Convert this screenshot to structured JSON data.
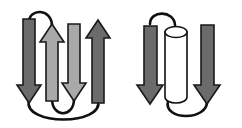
{
  "figure": {
    "name": "protein-secondary-structure-topology",
    "background_color": "#ffffff",
    "width": 242,
    "height": 128,
    "panel_count": 2
  },
  "palette": {
    "dark_strand": "#6b6b6b",
    "light_strand": "#a9a9a9",
    "helix_fill": "#ffffff",
    "outline": "#101010",
    "background": "#ffffff"
  },
  "panels": [
    {
      "id": "left-panel",
      "label": "beta-meander-four-strand-sheet",
      "element_count": 4,
      "elements": [
        {
          "id": "strand-1",
          "type": "beta-strand",
          "direction": "down",
          "color": "#6b6b6b",
          "shade": "dark",
          "shaft_x": 23,
          "shaft_width": 12,
          "top_y": 19,
          "bottom_y": 103,
          "head_width": 24,
          "head_height": 18
        },
        {
          "id": "strand-2",
          "type": "beta-strand",
          "direction": "up",
          "color": "#a9a9a9",
          "shade": "light",
          "shaft_x": 46,
          "shaft_width": 12,
          "top_y": 24,
          "bottom_y": 101,
          "head_width": 24,
          "head_height": 18
        },
        {
          "id": "strand-3",
          "type": "beta-strand",
          "direction": "down",
          "color": "#a9a9a9",
          "shade": "light",
          "shaft_x": 68,
          "shaft_width": 12,
          "top_y": 24,
          "bottom_y": 101,
          "head_width": 24,
          "head_height": 18
        },
        {
          "id": "strand-4",
          "type": "beta-strand",
          "direction": "up",
          "color": "#6b6b6b",
          "shade": "dark",
          "shaft_x": 92,
          "shaft_width": 12,
          "top_y": 20,
          "bottom_y": 103,
          "head_width": 24,
          "head_height": 18
        }
      ],
      "loops": [
        {
          "id": "loop-top-1-2",
          "connects": "strand-1-top to strand-2-top",
          "position": "top",
          "size": "small",
          "path": "M 29 22 C 29 8, 52 8, 52 26"
        },
        {
          "id": "loop-bottom-2-3",
          "connects": "strand-2-bottom to strand-3-bottom",
          "position": "bottom",
          "size": "small",
          "path": "M 52 99 C 52 118, 74 118, 74 99"
        },
        {
          "id": "loop-bottom-1-4",
          "connects": "strand-1-bottom to strand-4-bottom",
          "position": "bottom",
          "size": "large",
          "path": "M 29 100 C 22 126, 105 126, 98 100"
        }
      ]
    },
    {
      "id": "right-panel",
      "label": "beta-alpha-beta-motif",
      "element_count": 3,
      "elements": [
        {
          "id": "strand-5",
          "type": "beta-strand",
          "direction": "down",
          "color": "#6b6b6b",
          "shade": "dark",
          "shaft_x": 144,
          "shaft_width": 13,
          "top_y": 26,
          "bottom_y": 104,
          "head_width": 25,
          "head_height": 19
        },
        {
          "id": "helix-1",
          "type": "alpha-helix-cylinder",
          "color": "#ffffff",
          "shade": "white",
          "center_x": 176,
          "width": 22,
          "top_y": 27,
          "bottom_y": 102,
          "cap_ellipse_ry": 5
        },
        {
          "id": "strand-6",
          "type": "beta-strand",
          "direction": "down",
          "color": "#6b6b6b",
          "shade": "dark",
          "shaft_x": 201,
          "shaft_width": 13,
          "top_y": 25,
          "bottom_y": 104,
          "head_width": 25,
          "head_height": 19
        }
      ],
      "loops": [
        {
          "id": "loop-top-strand5-helix",
          "connects": "strand-5-top to helix-top",
          "position": "top",
          "size": "small",
          "path": "M 150 24 C 150 10, 174 10, 175 25"
        },
        {
          "id": "loop-bottom-helix-strand6",
          "connects": "helix-bottom to strand-6-bottom",
          "position": "bottom",
          "size": "medium",
          "path": "M 168 101 C 163 121, 208 121, 207 101"
        }
      ]
    }
  ]
}
